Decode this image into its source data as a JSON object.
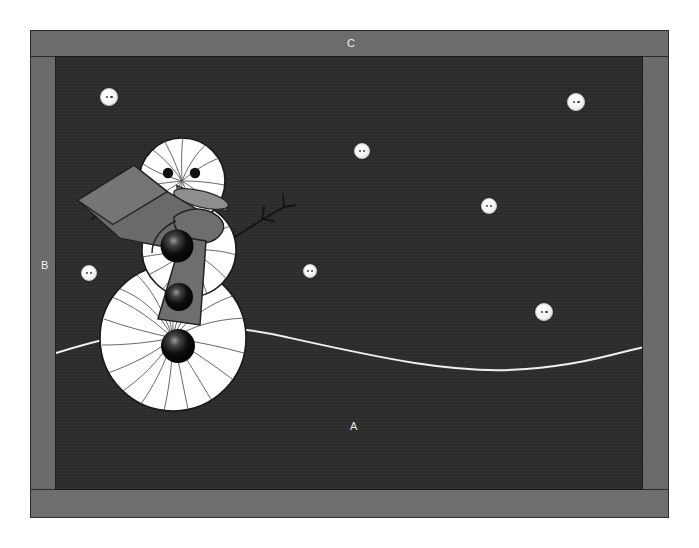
{
  "illustration": {
    "title": "Snowman scene in picture frame",
    "labels": [
      {
        "id": "A",
        "text": "A",
        "refers_to": "night-sky-background",
        "x": 350,
        "y": 421
      },
      {
        "id": "B",
        "text": "B",
        "refers_to": "left-frame-border",
        "x": 41,
        "y": 260
      },
      {
        "id": "C",
        "text": "C",
        "refers_to": "top-frame-border",
        "x": 347,
        "y": 38
      }
    ],
    "colors": {
      "frame_gray": "#6c6c6c",
      "frame_outline": "#2b2b2b",
      "sky_dark": "#2b2b2b",
      "snow_white": "#ffffff",
      "label_text": "#f2f2f2",
      "orb_black": "#000000",
      "scarf_gray": "#6e6e6e",
      "twig_brown": "#1a1a1a"
    },
    "frame": {
      "x": 30,
      "y": 30,
      "width": 639,
      "height": 488,
      "border_thickness": 26
    },
    "picture": {
      "x": 55,
      "y": 56,
      "width": 588,
      "height": 434
    },
    "snowflakes": [
      {
        "cx": 108,
        "cy": 96,
        "r": 9
      },
      {
        "cx": 575,
        "cy": 101,
        "r": 9
      },
      {
        "cx": 361,
        "cy": 150,
        "r": 8
      },
      {
        "cx": 488,
        "cy": 205,
        "r": 8
      },
      {
        "cx": 88,
        "cy": 272,
        "r": 8
      },
      {
        "cx": 309,
        "cy": 269,
        "r": 7
      },
      {
        "cx": 543,
        "cy": 311,
        "r": 9
      }
    ],
    "snowman": {
      "head": {
        "cx": 181,
        "cy": 180,
        "r": 43
      },
      "torso": {
        "cx": 188,
        "cy": 249,
        "r": 47
      },
      "base": {
        "cx": 172,
        "cy": 337,
        "r": 73
      },
      "eyes": [
        {
          "cx": 167,
          "cy": 172,
          "r": 5
        },
        {
          "cx": 194,
          "cy": 172,
          "r": 5
        }
      ],
      "nose": {
        "label": "carrot-nose",
        "color": "#8c8c8c"
      },
      "buttons": [
        {
          "cx": 176,
          "cy": 245,
          "r": 16
        },
        {
          "cx": 178,
          "cy": 296,
          "r": 14
        },
        {
          "cx": 177,
          "cy": 345,
          "r": 17
        }
      ],
      "scarf": {
        "label": "scarf",
        "color": "#6e6e6e"
      },
      "hat": {
        "label": "hat",
        "color": "#6a6a6a"
      },
      "arms": [
        {
          "side": "left"
        },
        {
          "side": "right"
        }
      ]
    },
    "ground_line": {
      "label": "snow-horizon-line",
      "color": "#f0f0f0",
      "thickness": 2,
      "path": "M 0 296 C 90 268, 150 262, 230 280 C 320 300, 400 318, 470 312 C 530 307, 560 296, 588 290"
    }
  }
}
